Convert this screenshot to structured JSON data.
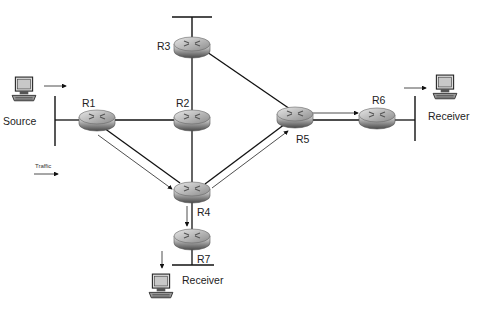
{
  "routers": [
    {
      "id": "R1",
      "label": "R1",
      "x": 97,
      "y": 120,
      "lx": 82,
      "ly": 104
    },
    {
      "id": "R2",
      "label": "R2",
      "x": 192,
      "y": 120,
      "lx": 176,
      "ly": 104
    },
    {
      "id": "R3",
      "label": "R3",
      "x": 192,
      "y": 45,
      "lx": 158,
      "ly": 50
    },
    {
      "id": "R4",
      "label": "R4",
      "x": 192,
      "y": 191,
      "lx": 197,
      "ly": 215
    },
    {
      "id": "R5",
      "label": "R5",
      "x": 295,
      "y": 117,
      "lx": 296,
      "ly": 141
    },
    {
      "id": "R6",
      "label": "R6",
      "x": 377,
      "y": 117,
      "lx": 371,
      "ly": 102
    },
    {
      "id": "R7",
      "label": "R7",
      "x": 192,
      "y": 238,
      "lx": 197,
      "ly": 262
    }
  ],
  "hosts": [
    {
      "id": "source",
      "label": "Source",
      "x": 20,
      "y": 80,
      "lx": 3,
      "ly": 124
    },
    {
      "id": "receiver-r6",
      "label": "Receiver",
      "x": 436,
      "y": 78,
      "lx": 428,
      "ly": 119
    },
    {
      "id": "receiver-r7",
      "label": "Receiver",
      "x": 152,
      "y": 273,
      "lx": 181,
      "ly": 283
    }
  ],
  "legend": {
    "label": "Traffic"
  }
}
